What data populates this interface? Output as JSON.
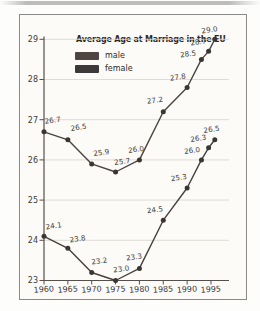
{
  "page": {
    "edge_color": "#b0afad"
  },
  "panel": {
    "title": "Average Age at Marriage in the EU"
  },
  "chart_data": {
    "type": "line",
    "title": "Average Age at Marriage in the EU",
    "xlabel": "",
    "ylabel": "",
    "ylim": [
      23,
      29
    ],
    "grid": true,
    "legend_position": "top-left",
    "x_ticks": [
      1960,
      1965,
      1970,
      1975,
      1980,
      1985,
      1990,
      1995
    ],
    "y_ticks": [
      23,
      24,
      25,
      26,
      27,
      28,
      29
    ],
    "x": [
      1960,
      1965,
      1970,
      1975,
      1980,
      1985,
      1990,
      1993,
      1994.5,
      1995.8
    ],
    "series": [
      {
        "name": "male",
        "color": "#4b433e",
        "swatch_color": "#4e4542",
        "values": [
          26.7,
          26.5,
          25.9,
          25.7,
          26.0,
          27.2,
          27.8,
          28.5,
          28.7,
          29.0
        ],
        "label_offsets": [
          [
            9,
            -9
          ],
          [
            11,
            -10
          ],
          [
            10,
            -9
          ],
          [
            7,
            -8
          ],
          [
            -3,
            -8
          ],
          [
            -8,
            -9
          ],
          [
            -9,
            -8
          ],
          [
            -13,
            -3
          ],
          [
            -10,
            -7
          ],
          [
            -5,
            -7
          ]
        ]
      },
      {
        "name": "female",
        "color": "#46413f",
        "swatch_color": "#3d393b",
        "values": [
          24.1,
          23.8,
          23.2,
          23.0,
          23.3,
          24.5,
          25.3,
          26.0,
          26.3,
          26.5
        ],
        "label_offsets": [
          [
            10,
            -8
          ],
          [
            10,
            -7
          ],
          [
            8,
            -9
          ],
          [
            6,
            -9
          ],
          [
            -5,
            -9
          ],
          [
            -8,
            -8
          ],
          [
            -8,
            -8
          ],
          [
            -9,
            -7
          ],
          [
            -10,
            -7
          ],
          [
            -3,
            -8
          ]
        ]
      }
    ],
    "render": {
      "x0_px": 44,
      "px_per_year": 4.771,
      "base_year": 1960,
      "baseline_px": 280.5,
      "px_per_unit": 40.2,
      "plot_right_px": 229,
      "axis_top_px": 36.5,
      "grid_color": "#ddd8d0",
      "axis_color": "#55504b",
      "dot_color": "#3a3633",
      "dot_radius": 2.5,
      "value_label_color": "#453f39",
      "tick_label_color": "#3e3935"
    }
  }
}
